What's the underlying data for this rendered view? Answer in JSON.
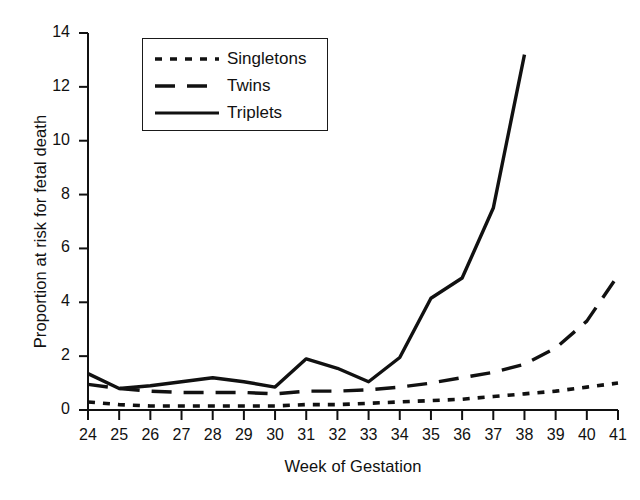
{
  "chart_data": {
    "type": "line",
    "title": "",
    "xlabel": "Week of Gestation",
    "ylabel": "Proportion at risk for fetal death",
    "x": [
      24,
      25,
      26,
      27,
      28,
      29,
      30,
      31,
      32,
      33,
      34,
      35,
      36,
      37,
      38,
      39,
      40,
      41
    ],
    "xlim": [
      24,
      41
    ],
    "ylim": [
      0,
      14
    ],
    "yticks": [
      0,
      2,
      4,
      6,
      8,
      10,
      12,
      14
    ],
    "xticks": [
      24,
      25,
      26,
      27,
      28,
      29,
      30,
      31,
      32,
      33,
      34,
      35,
      36,
      37,
      38,
      39,
      40,
      41
    ],
    "grid": false,
    "legend_position": "upper-left-inside",
    "series": [
      {
        "name": "Singletons",
        "style": "dotted",
        "x": [
          24,
          25,
          26,
          27,
          28,
          29,
          30,
          31,
          32,
          33,
          34,
          35,
          36,
          37,
          38,
          39,
          40,
          41
        ],
        "values": [
          0.3,
          0.2,
          0.15,
          0.15,
          0.15,
          0.15,
          0.15,
          0.2,
          0.2,
          0.25,
          0.3,
          0.35,
          0.4,
          0.5,
          0.6,
          0.7,
          0.85,
          1.0
        ]
      },
      {
        "name": "Twins",
        "style": "dashed",
        "x": [
          24,
          25,
          26,
          27,
          28,
          29,
          30,
          31,
          32,
          33,
          34,
          35,
          36,
          37,
          38,
          39,
          40,
          41
        ],
        "values": [
          0.95,
          0.8,
          0.7,
          0.65,
          0.65,
          0.65,
          0.6,
          0.7,
          0.7,
          0.75,
          0.85,
          1.0,
          1.2,
          1.4,
          1.7,
          2.3,
          3.3,
          5.0
        ]
      },
      {
        "name": "Triplets",
        "style": "solid",
        "x": [
          24,
          25,
          26,
          27,
          28,
          29,
          30,
          31,
          32,
          33,
          34,
          35,
          36,
          37,
          38
        ],
        "values": [
          1.35,
          0.8,
          0.9,
          1.05,
          1.2,
          1.05,
          0.85,
          1.9,
          1.55,
          1.05,
          1.95,
          4.15,
          4.9,
          7.5,
          13.2
        ]
      }
    ],
    "colors": {
      "line": "#111111",
      "background": "#ffffff",
      "axis": "#111111"
    }
  },
  "legend": {
    "items": [
      {
        "label": "Singletons",
        "style": "dotted"
      },
      {
        "label": "Twins",
        "style": "dashed"
      },
      {
        "label": "Triplets",
        "style": "solid"
      }
    ]
  }
}
